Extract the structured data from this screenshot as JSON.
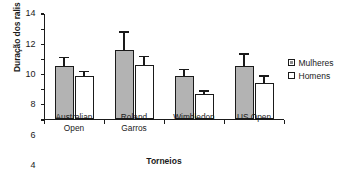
{
  "chart_data": {
    "type": "bar",
    "title": "",
    "xlabel": "Torneios",
    "ylabel": "Duração dos ralis (s)",
    "categories": [
      "Australian Open",
      "Roland Garros",
      "Wimbledon",
      "US Open"
    ],
    "category_lines": [
      [
        "Australian",
        "Open"
      ],
      [
        "Roland",
        "Garros"
      ],
      [
        "Wimbledon"
      ],
      [
        "US Open"
      ]
    ],
    "ylim": [
      0,
      14
    ],
    "yticks": [
      0,
      2,
      4,
      6,
      8,
      10,
      12,
      14
    ],
    "ytick_labels": [
      "0",
      "2",
      "4",
      "6",
      "8",
      "10",
      "12",
      "14"
    ],
    "grid": false,
    "legend_position": "right",
    "error_bars": "upper only",
    "series": [
      {
        "name": "Mulheres",
        "color": "#b3b3b3",
        "values": [
          7.1,
          9.1,
          5.7,
          7.0
        ],
        "errors": [
          1.2,
          2.6,
          1.1,
          1.8
        ]
      },
      {
        "name": "Homens",
        "color": "#ffffff",
        "values": [
          5.7,
          7.2,
          3.3,
          4.8
        ],
        "errors": [
          0.8,
          1.3,
          0.6,
          1.1
        ]
      }
    ]
  },
  "legend": {
    "items": [
      {
        "label": "Mulheres",
        "swatch": "filled-gray-square-icon"
      },
      {
        "label": "Homens",
        "swatch": "empty-white-square-icon"
      }
    ]
  }
}
